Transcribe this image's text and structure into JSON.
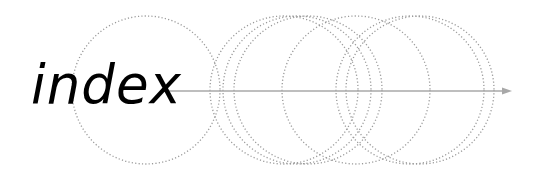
{
  "logo": {
    "title": "index",
    "colors": {
      "text": "#000000",
      "circles": "#9a9a9a",
      "arrow": "#a8a8a8",
      "background": "#ffffff"
    },
    "arrow": {
      "x1": 160,
      "x2": 512,
      "y": 91
    },
    "circles": [
      {
        "cx": 146,
        "cy": 90,
        "r": 74
      },
      {
        "cx": 284,
        "cy": 90,
        "r": 74
      },
      {
        "cx": 297,
        "cy": 90,
        "r": 74
      },
      {
        "cx": 308,
        "cy": 90,
        "r": 74
      },
      {
        "cx": 356,
        "cy": 90,
        "r": 74
      },
      {
        "cx": 410,
        "cy": 90,
        "r": 74
      },
      {
        "cx": 420,
        "cy": 90,
        "r": 74
      }
    ]
  }
}
